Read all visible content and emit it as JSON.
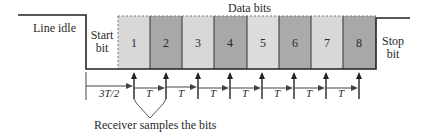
{
  "title": "Data bits",
  "labels": {
    "line_idle": "Line idle",
    "start_bit": [
      "Start",
      "bit"
    ],
    "stop_bit": [
      "Stop",
      "bit"
    ],
    "data_bits": "Data bits",
    "receiver": "Receiver samples  the bits"
  },
  "bits": [
    "1",
    "2",
    "3",
    "4",
    "5",
    "6",
    "7",
    "8"
  ],
  "timing": {
    "first_interval": "3T/2",
    "intervals": [
      "T",
      "T",
      "T",
      "T",
      "T",
      "T",
      "T"
    ]
  },
  "colors": {
    "light": "#d9d9d9",
    "dark": "#a9a9a9",
    "line": "#222222"
  }
}
